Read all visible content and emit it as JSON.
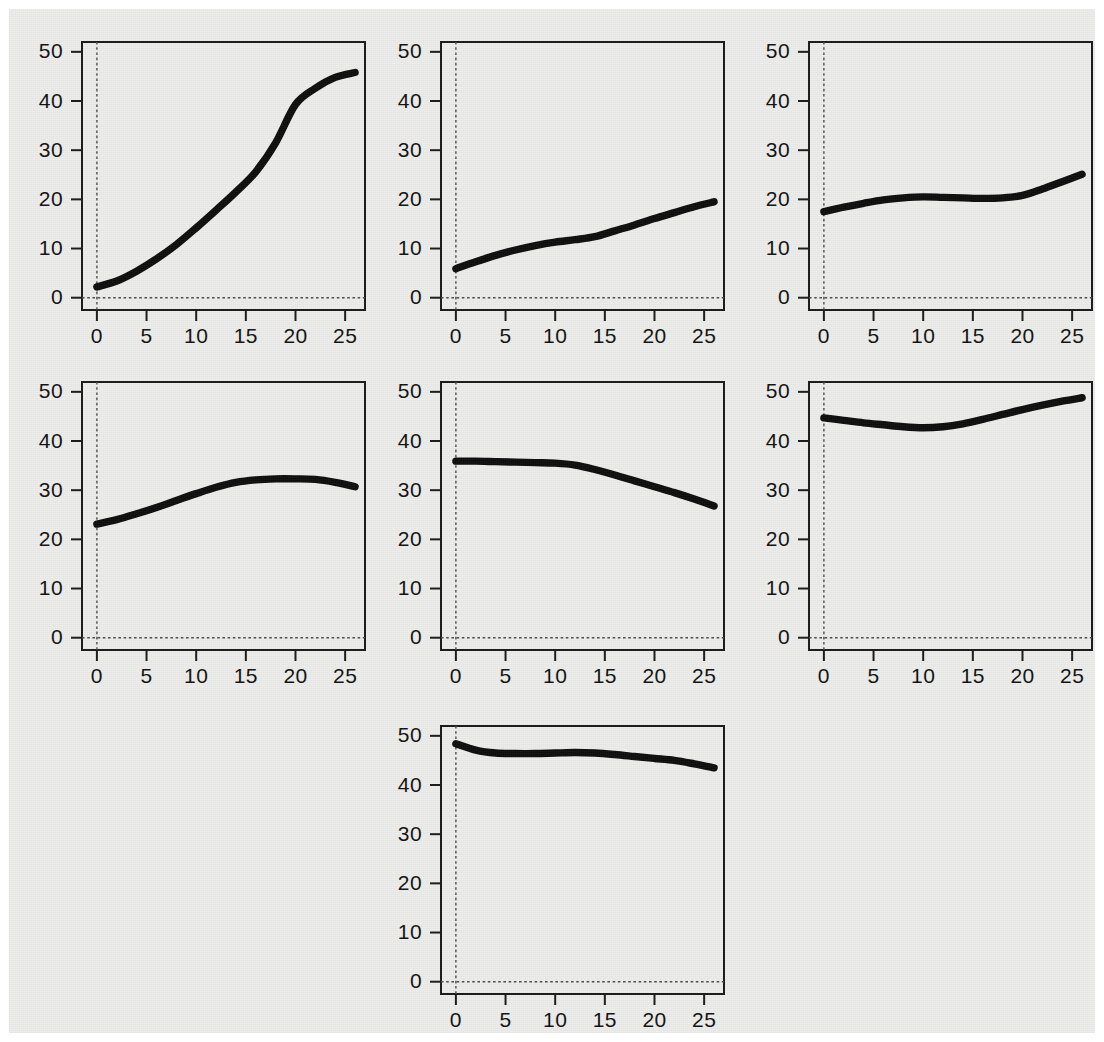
{
  "figure": {
    "background_color": "#eeeeec",
    "border_color": "#ffffff",
    "curve_color": "#0d0d0d",
    "axis_color": "#1a1a1a",
    "zero_line_color": "#4d4d4d",
    "width": 1104,
    "height": 1042,
    "panel_count": 7,
    "layout": "3 columns x 3 rows, last row has 1 centered panel"
  },
  "chart_data": [
    {
      "type": "line",
      "panel_index": 1,
      "title": "",
      "xlabel": "",
      "ylabel": "",
      "xlim": [
        -1.5,
        27
      ],
      "ylim": [
        -2.5,
        52
      ],
      "xticks": [
        0,
        5,
        10,
        15,
        20,
        25
      ],
      "yticks": [
        0,
        10,
        20,
        30,
        40,
        50
      ],
      "xticklabels": [
        "0",
        "5",
        "10",
        "15",
        "20",
        "25"
      ],
      "yticklabels": [
        "0",
        "10",
        "20",
        "30",
        "40",
        "50"
      ],
      "grid": false,
      "legend": "none",
      "annotations": [
        "dashed reference line at x=0",
        "dashed reference line at y=0"
      ],
      "x": [
        0,
        2,
        4,
        6,
        8,
        10,
        12,
        14,
        16,
        18,
        20,
        22,
        24,
        26
      ],
      "y": [
        2.2,
        3.4,
        5.4,
        7.9,
        10.8,
        14.2,
        17.8,
        21.5,
        25.6,
        31.5,
        39.3,
        42.6,
        44.8,
        45.8
      ]
    },
    {
      "type": "line",
      "panel_index": 2,
      "title": "",
      "xlabel": "",
      "ylabel": "",
      "xlim": [
        -1.5,
        27
      ],
      "ylim": [
        -2.5,
        52
      ],
      "xticks": [
        0,
        5,
        10,
        15,
        20,
        25
      ],
      "yticks": [
        0,
        10,
        20,
        30,
        40,
        50
      ],
      "xticklabels": [
        "0",
        "5",
        "10",
        "15",
        "20",
        "25"
      ],
      "yticklabels": [
        "0",
        "10",
        "20",
        "30",
        "40",
        "50"
      ],
      "grid": false,
      "legend": "none",
      "annotations": [
        "dashed reference line at x=0",
        "dashed reference line at y=0"
      ],
      "x": [
        0,
        2,
        4,
        6,
        8,
        10,
        12,
        14,
        16,
        18,
        20,
        22,
        24,
        26
      ],
      "y": [
        5.9,
        7.3,
        8.6,
        9.7,
        10.6,
        11.3,
        11.8,
        12.4,
        13.6,
        14.8,
        16.1,
        17.3,
        18.5,
        19.5
      ]
    },
    {
      "type": "line",
      "panel_index": 3,
      "title": "",
      "xlabel": "",
      "ylabel": "",
      "xlim": [
        -1.5,
        27
      ],
      "ylim": [
        -2.5,
        52
      ],
      "xticks": [
        0,
        5,
        10,
        15,
        20,
        25
      ],
      "yticks": [
        0,
        10,
        20,
        30,
        40,
        50
      ],
      "xticklabels": [
        "0",
        "5",
        "10",
        "15",
        "20",
        "25"
      ],
      "yticklabels": [
        "0",
        "10",
        "20",
        "30",
        "40",
        "50"
      ],
      "grid": false,
      "legend": "none",
      "annotations": [
        "dashed reference line at x=0",
        "dashed reference line at y=0"
      ],
      "x": [
        0,
        2,
        4,
        6,
        8,
        10,
        12,
        14,
        16,
        18,
        20,
        22,
        24,
        26
      ],
      "y": [
        17.5,
        18.4,
        19.2,
        19.9,
        20.3,
        20.5,
        20.4,
        20.3,
        20.2,
        20.3,
        20.8,
        22.1,
        23.6,
        25.1
      ]
    },
    {
      "type": "line",
      "panel_index": 4,
      "title": "",
      "xlabel": "",
      "ylabel": "",
      "xlim": [
        -1.5,
        27
      ],
      "ylim": [
        -2.5,
        52
      ],
      "xticks": [
        0,
        5,
        10,
        15,
        20,
        25
      ],
      "yticks": [
        0,
        10,
        20,
        30,
        40,
        50
      ],
      "xticklabels": [
        "0",
        "5",
        "10",
        "15",
        "20",
        "25"
      ],
      "yticklabels": [
        "0",
        "10",
        "20",
        "30",
        "40",
        "50"
      ],
      "grid": false,
      "legend": "none",
      "annotations": [
        "dashed reference line at x=0",
        "dashed reference line at y=0"
      ],
      "x": [
        0,
        2,
        4,
        6,
        8,
        10,
        12,
        14,
        16,
        18,
        20,
        22,
        24,
        26
      ],
      "y": [
        23.1,
        24.0,
        25.2,
        26.5,
        27.9,
        29.3,
        30.6,
        31.6,
        32.1,
        32.3,
        32.3,
        32.2,
        31.6,
        30.7
      ]
    },
    {
      "type": "line",
      "panel_index": 5,
      "title": "",
      "xlabel": "",
      "ylabel": "",
      "xlim": [
        -1.5,
        27
      ],
      "ylim": [
        -2.5,
        52
      ],
      "xticks": [
        0,
        5,
        10,
        15,
        20,
        25
      ],
      "yticks": [
        0,
        10,
        20,
        30,
        40,
        50
      ],
      "xticklabels": [
        "0",
        "5",
        "10",
        "15",
        "20",
        "25"
      ],
      "yticklabels": [
        "0",
        "10",
        "20",
        "30",
        "40",
        "50"
      ],
      "grid": false,
      "legend": "none",
      "annotations": [
        "dashed reference line at x=0",
        "dashed reference line at y=0"
      ],
      "x": [
        0,
        2,
        4,
        6,
        8,
        10,
        12,
        14,
        16,
        18,
        20,
        22,
        24,
        26
      ],
      "y": [
        35.9,
        35.9,
        35.8,
        35.7,
        35.6,
        35.5,
        35.1,
        34.2,
        33.1,
        31.9,
        30.7,
        29.5,
        28.2,
        26.8
      ]
    },
    {
      "type": "line",
      "panel_index": 6,
      "title": "",
      "xlabel": "",
      "ylabel": "",
      "xlim": [
        -1.5,
        27
      ],
      "ylim": [
        -2.5,
        52
      ],
      "xticks": [
        0,
        5,
        10,
        15,
        20,
        25
      ],
      "yticks": [
        0,
        10,
        20,
        30,
        40,
        50
      ],
      "xticklabels": [
        "0",
        "5",
        "10",
        "15",
        "20",
        "25"
      ],
      "yticklabels": [
        "0",
        "10",
        "20",
        "30",
        "40",
        "50"
      ],
      "grid": false,
      "legend": "none",
      "annotations": [
        "dashed reference line at x=0",
        "dashed reference line at y=0"
      ],
      "x": [
        0,
        2,
        4,
        6,
        8,
        10,
        12,
        14,
        16,
        18,
        20,
        22,
        24,
        26
      ],
      "y": [
        44.7,
        44.2,
        43.7,
        43.3,
        42.9,
        42.7,
        42.9,
        43.5,
        44.4,
        45.4,
        46.4,
        47.3,
        48.1,
        48.8
      ]
    },
    {
      "type": "line",
      "panel_index": 7,
      "title": "",
      "xlabel": "",
      "ylabel": "",
      "xlim": [
        -1.5,
        27
      ],
      "ylim": [
        -2.5,
        52
      ],
      "xticks": [
        0,
        5,
        10,
        15,
        20,
        25
      ],
      "yticks": [
        0,
        10,
        20,
        30,
        40,
        50
      ],
      "xticklabels": [
        "0",
        "5",
        "10",
        "15",
        "20",
        "25"
      ],
      "yticklabels": [
        "0",
        "10",
        "20",
        "30",
        "40",
        "50"
      ],
      "grid": false,
      "legend": "none",
      "annotations": [
        "dashed reference line at x=0",
        "dashed reference line at y=0"
      ],
      "x": [
        0,
        2,
        4,
        6,
        8,
        10,
        12,
        14,
        16,
        18,
        20,
        22,
        24,
        26
      ],
      "y": [
        48.4,
        47.1,
        46.5,
        46.4,
        46.4,
        46.5,
        46.6,
        46.5,
        46.2,
        45.8,
        45.4,
        45.0,
        44.3,
        43.5
      ]
    }
  ]
}
